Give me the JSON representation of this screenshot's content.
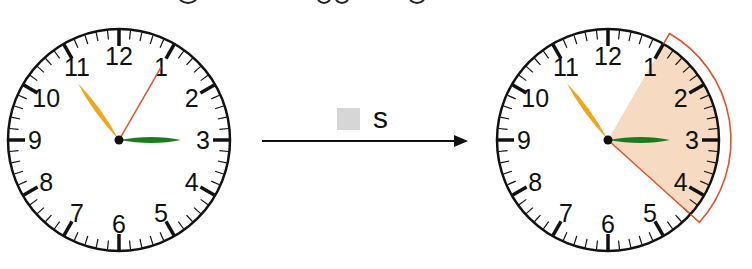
{
  "caption": {
    "visible_fragment": "cropped text line (only descenders visible)"
  },
  "transition": {
    "unit_label": "s",
    "blank_box": "answer-blank",
    "arrow": "right-arrow"
  },
  "colors": {
    "face": "#ffffff",
    "rim": "#111111",
    "numbers": "#111111",
    "hour_hand": "#1e7a1e",
    "minute_hand": "#f0a51e",
    "second_hand": "#e0522a",
    "elapsed_wedge": "#f7dac2",
    "bracket": "#e0522a",
    "blank_box": "#d6d6d6"
  },
  "clock_start": {
    "numbers": [
      "12",
      "1",
      "2",
      "3",
      "4",
      "5",
      "6",
      "7",
      "8",
      "9",
      "10",
      "11"
    ],
    "hour_hand_seconds_pos": 15,
    "minute_hand_seconds_pos": 54,
    "second_hand_seconds_pos": 5
  },
  "clock_end": {
    "numbers": [
      "12",
      "1",
      "2",
      "3",
      "4",
      "5",
      "6",
      "7",
      "8",
      "9",
      "10",
      "11"
    ],
    "hour_hand_seconds_pos": 15,
    "minute_hand_seconds_pos": 54,
    "second_hand_seconds_pos": 22,
    "elapsed_from": 5,
    "elapsed_to": 22
  }
}
